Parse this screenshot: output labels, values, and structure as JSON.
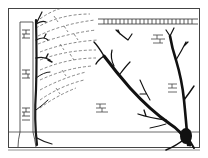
{
  "illustration": {
    "title": "",
    "description": "Line drawing of trees against a brick wall inside a rectangular frame",
    "colors": {
      "ink": "#1a1a1a",
      "dashed": "#555555",
      "frame": "#444444",
      "background": "#ffffff"
    },
    "elements": [
      {
        "name": "frame",
        "label": "rectangular border"
      },
      {
        "name": "brick-pillar",
        "label": "brick pillar on left"
      },
      {
        "name": "left-tree",
        "label": "thin tree against pillar"
      },
      {
        "name": "dashed-branches",
        "label": "dashed ghost branches fanning up-right"
      },
      {
        "name": "wall-top",
        "label": "brick wall top band with railing"
      },
      {
        "name": "right-tree",
        "label": "large dark tree in lower right"
      },
      {
        "name": "brick-marks",
        "label": "brick texture marks on wall"
      },
      {
        "name": "ground-line",
        "label": "ground line"
      }
    ]
  }
}
